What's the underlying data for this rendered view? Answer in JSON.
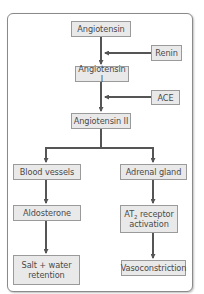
{
  "diagram": {
    "nodes": {
      "angiotensin": "Angiotensin",
      "renin": "Renin",
      "angiotensin_i": "Angiotensin I",
      "ace": "ACE",
      "angiotensin_ii": "Angiotensin II",
      "blood_vessels": "Blood vessels",
      "adrenal_gland": "Adrenal gland",
      "aldosterone": "Aldosterone",
      "at2_prefix": "AT",
      "at2_sub": "2",
      "at2_suffix": " receptor activation",
      "salt_water": "Salt + water retention",
      "vasoconstriction": "Vasoconstriction"
    },
    "edges": [
      {
        "from": "angiotensin",
        "to": "angiotensin_i"
      },
      {
        "from": "renin",
        "to": "angiotensin_to_angiotensin_i_edge"
      },
      {
        "from": "angiotensin_i",
        "to": "angiotensin_ii"
      },
      {
        "from": "ace",
        "to": "angiotensin_i_to_angiotensin_ii_edge"
      },
      {
        "from": "angiotensin_ii",
        "to": "blood_vessels"
      },
      {
        "from": "angiotensin_ii",
        "to": "adrenal_gland"
      },
      {
        "from": "blood_vessels",
        "to": "aldosterone"
      },
      {
        "from": "aldosterone",
        "to": "salt_water"
      },
      {
        "from": "adrenal_gland",
        "to": "at2_receptor"
      },
      {
        "from": "at2_receptor",
        "to": "vasoconstriction"
      }
    ],
    "colors": {
      "box_fill": "#e9e9e9",
      "box_border": "#9a9a9a",
      "arrow": "#555555",
      "text": "#4a4a4a"
    }
  }
}
